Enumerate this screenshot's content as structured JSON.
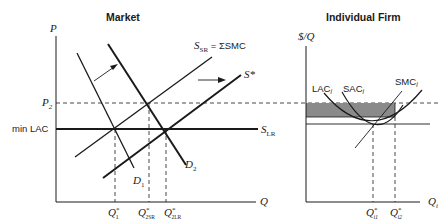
{
  "market": {
    "title": "Market",
    "y_axis_label": "P",
    "x_axis_label": "Q",
    "price_labels": {
      "p2": "P",
      "p2_sub": "2",
      "min_lac": "min LAC"
    },
    "curves": {
      "s_sr": {
        "main": "S",
        "sub": "SR",
        "rest": " = ΣSMC"
      },
      "s_star": "S*",
      "s_lr": {
        "main": "S",
        "sub": "LR"
      },
      "d1": {
        "main": "D",
        "sub": "1"
      },
      "d2": {
        "main": "D",
        "sub": "2"
      }
    },
    "quantity_labels": {
      "q1": {
        "main": "Q",
        "sup": "*",
        "sub": "1"
      },
      "q2sr": {
        "main": "Q",
        "sup": "*",
        "sub": "2SR"
      },
      "q2lr": {
        "main": "Q",
        "sup": "*",
        "sub": "2LR"
      }
    }
  },
  "firm": {
    "title": "Individual Firm",
    "y_axis_label": "$/Q",
    "x_axis_label": {
      "main": "Q",
      "sub": "i"
    },
    "curves": {
      "lac": {
        "main": "LAC",
        "sub": "i"
      },
      "sac": {
        "main": "SAC",
        "sub": "i"
      },
      "smc": {
        "main": "SMC",
        "sub": "i"
      }
    },
    "quantity_labels": {
      "qi1": {
        "main": "Q",
        "sup": "*",
        "sub": "i1"
      },
      "qi2": {
        "main": "Q",
        "sup": "*",
        "sub": "i2"
      }
    },
    "profit_area_color": "#8a8a8a"
  },
  "colors": {
    "line": "#1a1a1a",
    "shade": "#8a8a8a"
  }
}
